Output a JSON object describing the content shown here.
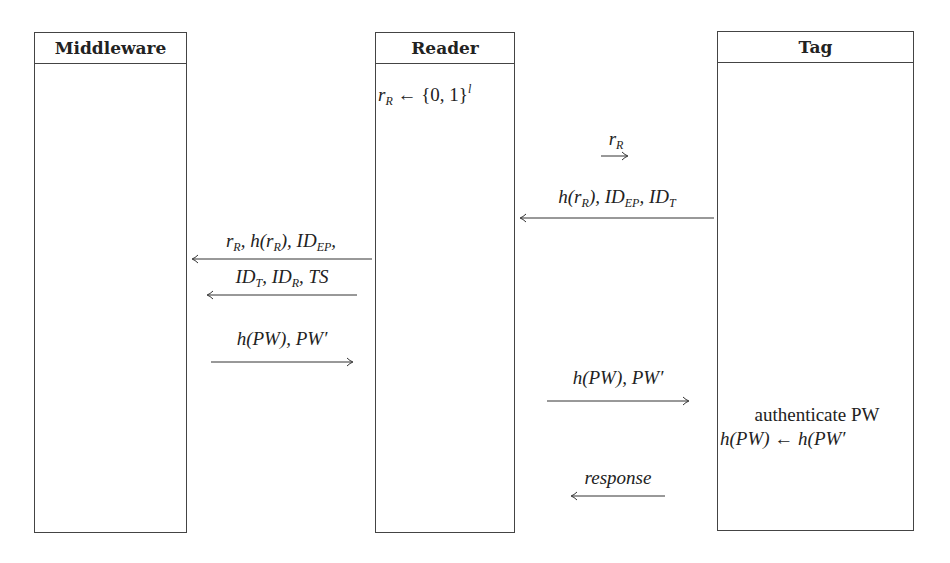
{
  "lanes": {
    "middleware": "Middleware",
    "reader": "Reader",
    "tag": "Tag"
  },
  "reader_step": {
    "lhs": "r",
    "lhs_sub": "R",
    "op": " ← {0, 1}",
    "sup": "l"
  },
  "messages": {
    "m1": {
      "text": "r",
      "sub": "R",
      "direction": "right"
    },
    "m2": {
      "parts": [
        "h(r",
        "R",
        "), ID",
        "EP",
        ", ID",
        "T"
      ],
      "direction": "left"
    },
    "m3a": {
      "parts": [
        "r",
        "R",
        ", h(r",
        "R",
        "), ID",
        "EP",
        ","
      ],
      "direction": "left"
    },
    "m3b": {
      "parts": [
        "ID",
        "T",
        ", ID",
        "R",
        ", TS"
      ],
      "direction": "left"
    },
    "m4": {
      "text": "h(PW), PW′",
      "direction": "right"
    },
    "m5": {
      "text": "h(PW), PW′",
      "direction": "right"
    },
    "m6": {
      "text": "response",
      "direction": "left"
    }
  },
  "tag_step": {
    "line1": "authenticate PW",
    "line2": "h(PW) ← h(PW′"
  }
}
